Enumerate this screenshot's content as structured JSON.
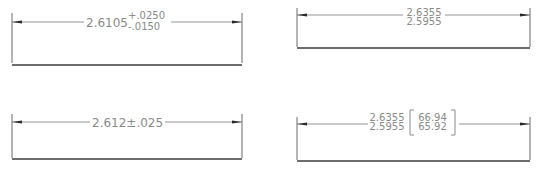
{
  "diagram": {
    "panels": [
      {
        "id": "deviation",
        "nominal": "2.6105",
        "upper_tol": "+.0250",
        "lower_tol": "-.0150"
      },
      {
        "id": "limits",
        "upper_limit": "2.6355",
        "lower_limit": "2.5955"
      },
      {
        "id": "symmetrical",
        "text": "2.612±.025"
      },
      {
        "id": "limits-alternate-units",
        "upper_limit": "2.6355",
        "lower_limit": "2.5955",
        "alt_upper": "66.94",
        "alt_lower": "65.92"
      }
    ],
    "colors": {
      "text": "#8a8a8a",
      "extension_line": "#6a6a6a",
      "base_line": "#3c3c3c",
      "arrow": "#2a2a2a"
    }
  }
}
